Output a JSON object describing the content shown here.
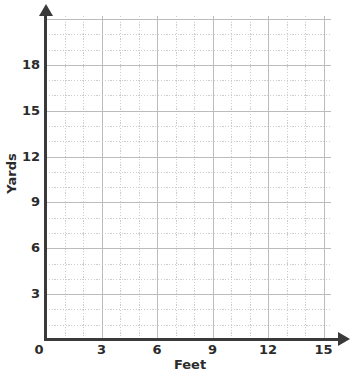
{
  "chart_data": {
    "type": "scatter",
    "title": "",
    "subtitle": "",
    "xlabel": "Feet",
    "ylabel": "Yards",
    "xlim": [
      0,
      15.4
    ],
    "ylim": [
      0,
      21.2
    ],
    "x_ticks": [
      "0",
      "3",
      "6",
      "9",
      "12",
      "15"
    ],
    "x_tick_values": [
      0,
      3,
      6,
      9,
      12,
      15
    ],
    "y_ticks": [
      "3",
      "6",
      "9",
      "12",
      "15",
      "18"
    ],
    "y_tick_values": [
      3,
      6,
      9,
      12,
      15,
      18
    ],
    "origin_label": "0",
    "x_minor_step": 1,
    "y_minor_step": 1,
    "x_major_step": 3,
    "y_major_step": 3,
    "grid": true,
    "grid_style": "dotted",
    "legend": null,
    "series": [],
    "values": [],
    "annotations": [],
    "colors": {
      "background": "#ffffff",
      "axis": "#3a3a3a",
      "grid_minor": "#cdcdcd",
      "grid_major": "#bcbcbc",
      "text": "#2b2b2b"
    }
  },
  "axes": {
    "x": {
      "title": "Feet",
      "ticks": [
        {
          "label": "0",
          "value": 0
        },
        {
          "label": "3",
          "value": 3
        },
        {
          "label": "6",
          "value": 6
        },
        {
          "label": "9",
          "value": 9
        },
        {
          "label": "12",
          "value": 12
        },
        {
          "label": "15",
          "value": 15
        }
      ]
    },
    "y": {
      "title": "Yards",
      "ticks": [
        {
          "label": "3",
          "value": 3
        },
        {
          "label": "6",
          "value": 6
        },
        {
          "label": "9",
          "value": 9
        },
        {
          "label": "12",
          "value": 12
        },
        {
          "label": "15",
          "value": 15
        },
        {
          "label": "18",
          "value": 18
        }
      ]
    }
  }
}
